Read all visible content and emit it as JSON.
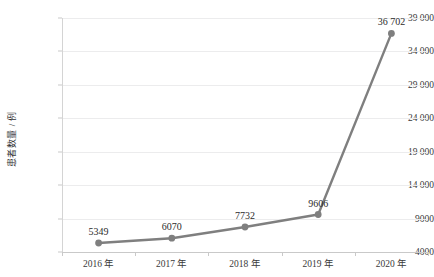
{
  "chart_data": {
    "type": "line",
    "title": "",
    "subtitle": "",
    "xlabel": "",
    "ylabel": "患者数量 / 例",
    "categories": [
      "2016 年",
      "2017 年",
      "2018 年",
      "2019 年",
      "2020 年"
    ],
    "values": [
      5349,
      6070,
      7732,
      9606,
      36702
    ],
    "point_labels": [
      "5349",
      "6070",
      "7732",
      "9606",
      "36 702"
    ],
    "series": [
      {
        "name": "患者数量",
        "values": [
          5349,
          6070,
          7732,
          9606,
          36702
        ],
        "color": "#7f7f7f",
        "marker": "circle"
      }
    ],
    "ylim": [
      4000,
      39000
    ],
    "ytick_values": [
      4000,
      9000,
      14000,
      19000,
      24000,
      29000,
      34000,
      39000
    ],
    "ytick_labels": [
      "4000",
      "9000",
      "14 000",
      "19 000",
      "24 000",
      "29 000",
      "34 000",
      "39 000"
    ],
    "grid": true,
    "grid_axis": "y",
    "grid_color": "#ececed",
    "legend": false,
    "legend_position": "none",
    "line_color": "#7f7f7f",
    "marker_color": "#7f7f7f",
    "background": "#ffffff",
    "axis_color": "#c9c9c9",
    "text_color": "#3a3a3a"
  }
}
